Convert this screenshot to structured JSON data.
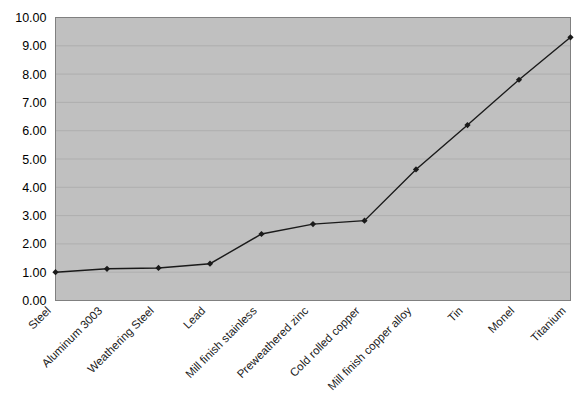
{
  "chart_data": {
    "type": "line",
    "title": "",
    "subtitle": "",
    "xlabel": "",
    "ylabel": "",
    "categories": [
      "Steel",
      "Aluminum 3003",
      "Weathering Steel",
      "Lead",
      "Mill finish stainless",
      "Preweathered zinc",
      "Cold rolled copper",
      "Mill finish copper alloy",
      "Tin",
      "Monel",
      "Titanium"
    ],
    "values": [
      1.0,
      1.12,
      1.15,
      1.3,
      2.35,
      2.7,
      2.82,
      4.63,
      6.2,
      7.8,
      9.3
    ],
    "ylim": [
      0.0,
      10.0
    ],
    "ytick_labels": [
      "0.00",
      "1.00",
      "2.00",
      "3.00",
      "4.00",
      "5.00",
      "6.00",
      "7.00",
      "8.00",
      "9.00",
      "10.00"
    ],
    "ytick_values": [
      0,
      1,
      2,
      3,
      4,
      5,
      6,
      7,
      8,
      9,
      10
    ],
    "grid": "horizontal",
    "legend": "none",
    "marker": "diamond",
    "series_color": "#1a1a1a",
    "plot_background": "#c0c0c0",
    "grid_color": "#aaaaaa",
    "axis_color": "#808080",
    "figure_background": "#ffffff",
    "xtick_label_rotation": 45
  }
}
